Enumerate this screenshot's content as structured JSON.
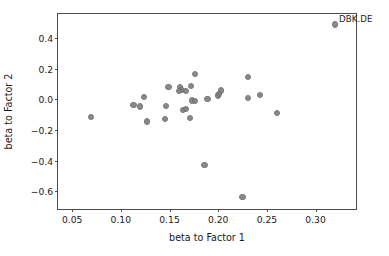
{
  "chart_data": {
    "type": "scatter",
    "title": "",
    "xlabel": "beta to Factor 1",
    "ylabel": "beta to Factor 2",
    "xlim": [
      0.0355,
      0.3415
    ],
    "ylim": [
      -0.715,
      0.555
    ],
    "xticks": [
      0.05,
      0.1,
      0.15,
      0.2,
      0.25,
      0.3
    ],
    "xtick_labels": [
      "0.05",
      "0.10",
      "0.15",
      "0.20",
      "0.25",
      "0.30"
    ],
    "yticks": [
      0.4,
      0.2,
      0.0,
      -0.2,
      -0.4,
      -0.6
    ],
    "ytick_labels": [
      "0.4",
      "0.2",
      "0.0",
      "−0.2",
      "−0.4",
      "−0.6"
    ],
    "grid": false,
    "legend": null,
    "marker_color": "#808080",
    "marker_edge_color": "#6e6e6e",
    "axis_color": "#4d4d4d",
    "series": [
      {
        "name": "stocks",
        "points": [
          {
            "x": 0.32,
            "y": 0.487,
            "label": "DBK.DE"
          },
          {
            "x": 0.176,
            "y": 0.163,
            "label": ""
          },
          {
            "x": 0.231,
            "y": 0.147,
            "label": ""
          },
          {
            "x": 0.149,
            "y": 0.078,
            "label": ""
          },
          {
            "x": 0.161,
            "y": 0.077,
            "label": ""
          },
          {
            "x": 0.163,
            "y": 0.062,
            "label": ""
          },
          {
            "x": 0.172,
            "y": 0.086,
            "label": ""
          },
          {
            "x": 0.16,
            "y": 0.052,
            "label": ""
          },
          {
            "x": 0.167,
            "y": 0.053,
            "label": ""
          },
          {
            "x": 0.203,
            "y": 0.057,
            "label": ""
          },
          {
            "x": 0.2,
            "y": 0.024,
            "label": ""
          },
          {
            "x": 0.201,
            "y": 0.033,
            "label": ""
          },
          {
            "x": 0.124,
            "y": 0.016,
            "label": ""
          },
          {
            "x": 0.189,
            "y": 0.002,
            "label": ""
          },
          {
            "x": 0.243,
            "y": 0.03,
            "label": ""
          },
          {
            "x": 0.231,
            "y": 0.01,
            "label": ""
          },
          {
            "x": 0.173,
            "y": -0.008,
            "label": ""
          },
          {
            "x": 0.176,
            "y": -0.01,
            "label": ""
          },
          {
            "x": 0.113,
            "y": -0.036,
            "label": ""
          },
          {
            "x": 0.12,
            "y": -0.048,
            "label": ""
          },
          {
            "x": 0.146,
            "y": -0.043,
            "label": ""
          },
          {
            "x": 0.164,
            "y": -0.072,
            "label": ""
          },
          {
            "x": 0.167,
            "y": -0.065,
            "label": ""
          },
          {
            "x": 0.26,
            "y": -0.088,
            "label": ""
          },
          {
            "x": 0.069,
            "y": -0.118,
            "label": ""
          },
          {
            "x": 0.145,
            "y": -0.13,
            "label": ""
          },
          {
            "x": 0.171,
            "y": -0.123,
            "label": ""
          },
          {
            "x": 0.127,
            "y": -0.145,
            "label": ""
          },
          {
            "x": 0.186,
            "y": -0.43,
            "label": ""
          },
          {
            "x": 0.225,
            "y": -0.639,
            "label": ""
          }
        ]
      }
    ]
  }
}
